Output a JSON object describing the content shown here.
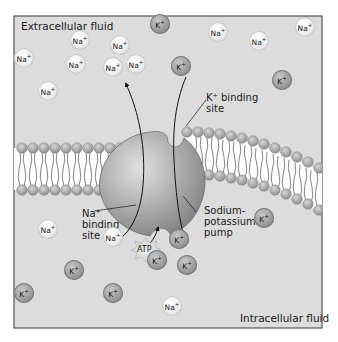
{
  "diagram": {
    "regions": {
      "extracellular_label": "Extracellular fluid",
      "intracellular_label": "Intracellular fluid"
    },
    "callouts": {
      "k_binding_site": {
        "line1": "K⁺ binding",
        "line2": "site"
      },
      "na_binding_site": {
        "line1": "Na⁺",
        "line2": "binding",
        "line3": "site"
      },
      "pump": {
        "line1": "Sodium-",
        "line2": "potassium",
        "line3": "pump"
      },
      "atp": "ATP"
    },
    "colors": {
      "background": "#dcdcdc",
      "frame_border": "#555555",
      "na_ion": "#f0f0f0",
      "k_ion": "#9a9a9a",
      "pump": "#a8a8a8",
      "membrane_head": "#a6a6a6"
    },
    "ions": [
      {
        "type": "na",
        "label": "Na",
        "charge": "+",
        "x": 24,
        "y": 58
      },
      {
        "type": "na",
        "label": "Na",
        "charge": "+",
        "x": 80,
        "y": 40
      },
      {
        "type": "na",
        "label": "Na",
        "charge": "+",
        "x": 76,
        "y": 64
      },
      {
        "type": "na",
        "label": "Na",
        "charge": "+",
        "x": 120,
        "y": 45
      },
      {
        "type": "na",
        "label": "Na",
        "charge": "+",
        "x": 113,
        "y": 67
      },
      {
        "type": "na",
        "label": "Na",
        "charge": "+",
        "x": 136,
        "y": 64
      },
      {
        "type": "na",
        "label": "Na",
        "charge": "+",
        "x": 48,
        "y": 91
      },
      {
        "type": "k",
        "label": "K",
        "charge": "+",
        "x": 160,
        "y": 24
      },
      {
        "type": "na",
        "label": "Na",
        "charge": "+",
        "x": 218,
        "y": 32
      },
      {
        "type": "na",
        "label": "Na",
        "charge": "+",
        "x": 259,
        "y": 41
      },
      {
        "type": "na",
        "label": "Na",
        "charge": "+",
        "x": 305,
        "y": 27
      },
      {
        "type": "k",
        "label": "K",
        "charge": "+",
        "x": 181,
        "y": 66
      },
      {
        "type": "k",
        "label": "K",
        "charge": "+",
        "x": 282,
        "y": 80
      },
      {
        "type": "na",
        "label": "Na",
        "charge": "+",
        "x": 48,
        "y": 229
      },
      {
        "type": "na",
        "label": "Na",
        "charge": "+",
        "x": 113,
        "y": 237
      },
      {
        "type": "k",
        "label": "K",
        "charge": "+",
        "x": 264,
        "y": 218
      },
      {
        "type": "k",
        "label": "K",
        "charge": "+",
        "x": 179,
        "y": 239
      },
      {
        "type": "k",
        "label": "K",
        "charge": "+",
        "x": 157,
        "y": 260
      },
      {
        "type": "k",
        "label": "K",
        "charge": "+",
        "x": 187,
        "y": 265
      },
      {
        "type": "k",
        "label": "K",
        "charge": "+",
        "x": 74,
        "y": 270
      },
      {
        "type": "k",
        "label": "K",
        "charge": "+",
        "x": 24,
        "y": 293
      },
      {
        "type": "k",
        "label": "K",
        "charge": "+",
        "x": 113,
        "y": 293
      },
      {
        "type": "na",
        "label": "Na",
        "charge": "+",
        "x": 172,
        "y": 306
      }
    ]
  }
}
